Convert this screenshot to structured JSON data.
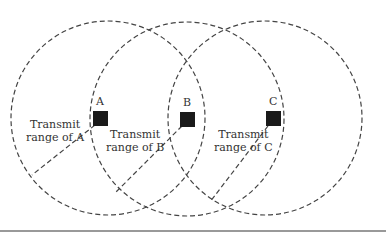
{
  "diagram": {
    "nodes": [
      {
        "id": "A",
        "label": "A",
        "range_label_line1": "Transmit",
        "range_label_line2": "range of A"
      },
      {
        "id": "B",
        "label": "B",
        "range_label_line1": "Transmit",
        "range_label_line2": "range of B"
      },
      {
        "id": "C",
        "label": "C",
        "range_label_line1": "Transmit",
        "range_label_line2": "range of C"
      }
    ],
    "colors": {
      "stroke": "#444444",
      "node": "#1a1a1a"
    }
  }
}
